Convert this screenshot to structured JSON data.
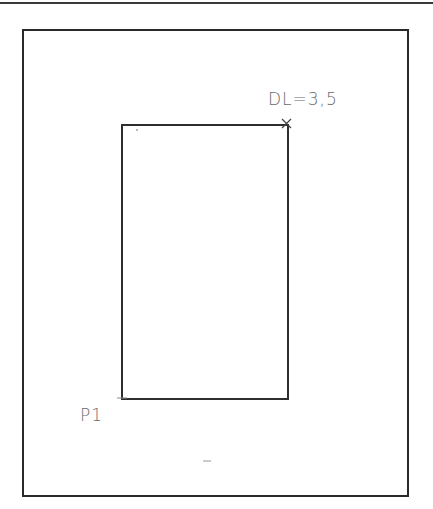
{
  "drawing": {
    "annotations": {
      "corner_label": "DL=3,5",
      "point_label": "P1"
    },
    "geometry": {
      "outer_frame": {
        "x": 22,
        "y": 29,
        "w": 385,
        "h": 466
      },
      "inner_rect": {
        "x": 121,
        "y": 124,
        "w": 166,
        "h": 274
      },
      "corner_marker": "x-mark",
      "point_marker": "tick-mark"
    },
    "colors": {
      "line": "#2e2e2e",
      "text": "#6a6a6a"
    }
  }
}
